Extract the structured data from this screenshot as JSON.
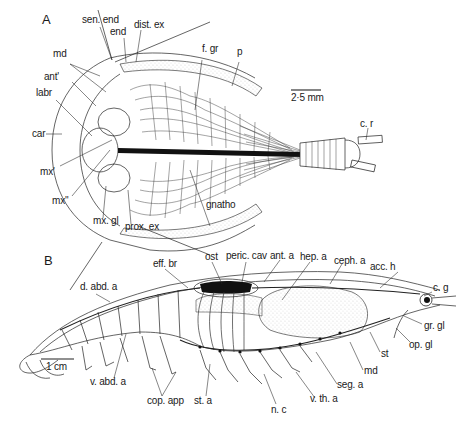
{
  "figure": {
    "panels": [
      {
        "id": "A",
        "label": "A",
        "description": "Ventral view of branchiopod (Triops-like) with carapace, limbs and telson",
        "scale_bar": "2·5 mm",
        "labels": {
          "sen_end": "sen. end",
          "end": "end",
          "dist_ex": "dist. ex",
          "md": "md",
          "ant1": "ant'",
          "labr": "labr",
          "car": "car",
          "mx1": "mx'",
          "mx2": "mx''",
          "mx_gl": "mx. gl",
          "prox_ex": "prox. ex",
          "gnatho": "gnatho",
          "f_gr": "f. gr",
          "p": "p",
          "c_r": "c. r"
        }
      },
      {
        "id": "B",
        "label": "B",
        "description": "Lateral view of decapod crustacean showing circulatory and nervous systems",
        "scale_bar": "1 cm",
        "labels": {
          "d_abd_a": "d. abd. a",
          "eff_br": "eff. br",
          "ost": "ost",
          "peric_cav": "peric. cav",
          "ant_a": "ant. a",
          "hep_a": "hep. a",
          "ceph_a": "ceph. a",
          "acc_h": "acc. h",
          "c_g": "c. g",
          "gr_gl": "gr. gl",
          "op_gl": "op. gl",
          "st": "st",
          "md": "md",
          "seg_a": "seg. a",
          "v_th_a": "v. th. a",
          "n_c": "n. c",
          "st_a": "st. a",
          "cop_app": "cop. app",
          "v_abd_a": "v. abd. a"
        }
      }
    ]
  }
}
